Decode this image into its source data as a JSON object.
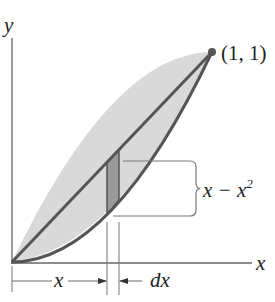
{
  "diagram": {
    "axes": {
      "x_label": "x",
      "y_label": "y"
    },
    "point_label": "(1, 1)",
    "height_label": {
      "main": "x − x",
      "exponent": "2"
    },
    "width_labels": {
      "x": "x",
      "dx": "dx"
    },
    "curves": [
      {
        "name": "upper",
        "equation": "y = x"
      },
      {
        "name": "lower",
        "equation": "y = x^2"
      }
    ],
    "strip": {
      "x_start": 0.475,
      "x_end": 0.535
    },
    "colors": {
      "region_fill": "#d9d9d9",
      "strip_fill": "#9a9a9a",
      "curve_stroke": "#555555",
      "axis_stroke": "#555555",
      "text": "#222222"
    }
  }
}
